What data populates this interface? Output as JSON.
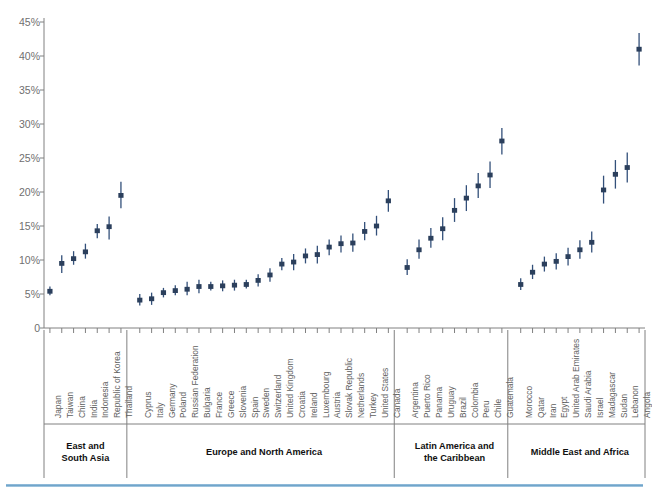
{
  "chart_data": {
    "type": "scatter",
    "title": "",
    "subtitle": "",
    "xlabel": "",
    "ylabel": "",
    "ylim": [
      0,
      45
    ],
    "ytick_values": [
      0,
      5,
      10,
      15,
      20,
      25,
      30,
      35,
      40,
      45
    ],
    "ytick_labels": [
      "0",
      "5%",
      "10%",
      "15%",
      "20%",
      "25%",
      "30%",
      "35%",
      "40%",
      "45%"
    ],
    "grid": false,
    "legend": "none",
    "marker_color": "#2b3f5c",
    "range_color": "#33507a",
    "axis_color": "#808080",
    "series_name": "Value with range",
    "groups": [
      {
        "name": "East and\nSouth Asia",
        "label_line1": "East and",
        "label_line2": "South Asia",
        "points": [
          {
            "category": "Japan",
            "value": 5.4,
            "low": 4.8,
            "high": 6.1
          },
          {
            "category": "Taiwan",
            "value": 9.5,
            "low": 8.1,
            "high": 10.7
          },
          {
            "category": "China",
            "value": 10.2,
            "low": 9.3,
            "high": 11.3
          },
          {
            "category": "India",
            "value": 11.2,
            "low": 10.2,
            "high": 12.4
          },
          {
            "category": "Indonesia",
            "value": 14.3,
            "low": 13.2,
            "high": 15.3
          },
          {
            "category": "Republic of Korea",
            "value": 14.9,
            "low": 13.0,
            "high": 16.4
          },
          {
            "category": "Thailand",
            "value": 19.5,
            "low": 17.6,
            "high": 21.5
          }
        ]
      },
      {
        "name": "Europe and North America",
        "label_line1": "Europe and North America",
        "label_line2": "",
        "points": [
          {
            "category": "Cyprus",
            "value": 4.1,
            "low": 3.3,
            "high": 5.0
          },
          {
            "category": "Italy",
            "value": 4.3,
            "low": 3.4,
            "high": 5.2
          },
          {
            "category": "Germany",
            "value": 5.2,
            "low": 4.5,
            "high": 5.9
          },
          {
            "category": "Poland",
            "value": 5.5,
            "low": 4.8,
            "high": 6.3
          },
          {
            "category": "Russian Federation",
            "value": 5.7,
            "low": 4.8,
            "high": 6.8
          },
          {
            "category": "Bulgaria",
            "value": 6.1,
            "low": 5.1,
            "high": 7.1
          },
          {
            "category": "France",
            "value": 6.1,
            "low": 5.5,
            "high": 6.8
          },
          {
            "category": "Greece",
            "value": 6.2,
            "low": 5.4,
            "high": 7.0
          },
          {
            "category": "Slovenia",
            "value": 6.3,
            "low": 5.5,
            "high": 7.1
          },
          {
            "category": "Spain",
            "value": 6.4,
            "low": 5.8,
            "high": 7.1
          },
          {
            "category": "Sweden",
            "value": 7.0,
            "low": 6.1,
            "high": 7.9
          },
          {
            "category": "Switzerland",
            "value": 7.8,
            "low": 6.8,
            "high": 8.8
          },
          {
            "category": "United Kingdom",
            "value": 9.4,
            "low": 8.5,
            "high": 10.3
          },
          {
            "category": "Croatia",
            "value": 9.7,
            "low": 8.5,
            "high": 10.9
          },
          {
            "category": "Ireland",
            "value": 10.6,
            "low": 9.5,
            "high": 11.7
          },
          {
            "category": "Luxembourg",
            "value": 10.8,
            "low": 9.5,
            "high": 12.1
          },
          {
            "category": "Austria",
            "value": 11.9,
            "low": 10.7,
            "high": 13.0
          },
          {
            "category": "Slovak Republic",
            "value": 12.4,
            "low": 11.1,
            "high": 13.6
          },
          {
            "category": "Netherlands",
            "value": 12.5,
            "low": 11.2,
            "high": 13.9
          },
          {
            "category": "Turkey",
            "value": 14.2,
            "low": 12.9,
            "high": 15.6
          },
          {
            "category": "United States",
            "value": 15.0,
            "low": 13.6,
            "high": 16.5
          },
          {
            "category": "Canada",
            "value": 18.7,
            "low": 17.1,
            "high": 20.3
          }
        ]
      },
      {
        "name": "Latin America and the Caribbean",
        "label_line1": "Latin America and",
        "label_line2": "the Caribbean",
        "points": [
          {
            "category": "Argentina",
            "value": 8.9,
            "low": 7.8,
            "high": 10.1
          },
          {
            "category": "Puerto Rico",
            "value": 11.5,
            "low": 10.2,
            "high": 13.0
          },
          {
            "category": "Panama",
            "value": 13.2,
            "low": 11.8,
            "high": 14.7
          },
          {
            "category": "Uruguay",
            "value": 14.6,
            "low": 12.9,
            "high": 16.3
          },
          {
            "category": "Brazil",
            "value": 17.3,
            "low": 15.6,
            "high": 19.1
          },
          {
            "category": "Colombia",
            "value": 19.1,
            "low": 17.2,
            "high": 21.0
          },
          {
            "category": "Peru",
            "value": 20.9,
            "low": 19.1,
            "high": 22.8
          },
          {
            "category": "Chile",
            "value": 22.5,
            "low": 20.6,
            "high": 24.5
          },
          {
            "category": "Guatemala",
            "value": 27.5,
            "low": 25.5,
            "high": 29.4
          }
        ]
      },
      {
        "name": "Middle East and Africa",
        "label_line1": "Middle East and Africa",
        "label_line2": "",
        "points": [
          {
            "category": "Morocco",
            "value": 6.4,
            "low": 5.6,
            "high": 7.3
          },
          {
            "category": "Qatar",
            "value": 8.2,
            "low": 7.2,
            "high": 9.3
          },
          {
            "category": "Iran",
            "value": 9.4,
            "low": 8.3,
            "high": 10.5
          },
          {
            "category": "Egypt",
            "value": 9.8,
            "low": 8.6,
            "high": 11.0
          },
          {
            "category": "United Arab Emirates",
            "value": 10.5,
            "low": 9.2,
            "high": 11.8
          },
          {
            "category": "Saudi Arabia",
            "value": 11.5,
            "low": 10.2,
            "high": 12.9
          },
          {
            "category": "Israel",
            "value": 12.6,
            "low": 11.1,
            "high": 14.2
          },
          {
            "category": "Madagascar",
            "value": 20.3,
            "low": 18.3,
            "high": 22.4
          },
          {
            "category": "Sudan",
            "value": 22.6,
            "low": 20.5,
            "high": 24.7
          },
          {
            "category": "Lebanon",
            "value": 23.6,
            "low": 21.4,
            "high": 25.8
          },
          {
            "category": "Angola",
            "value": 41.0,
            "low": 38.6,
            "high": 43.4
          }
        ]
      }
    ]
  }
}
